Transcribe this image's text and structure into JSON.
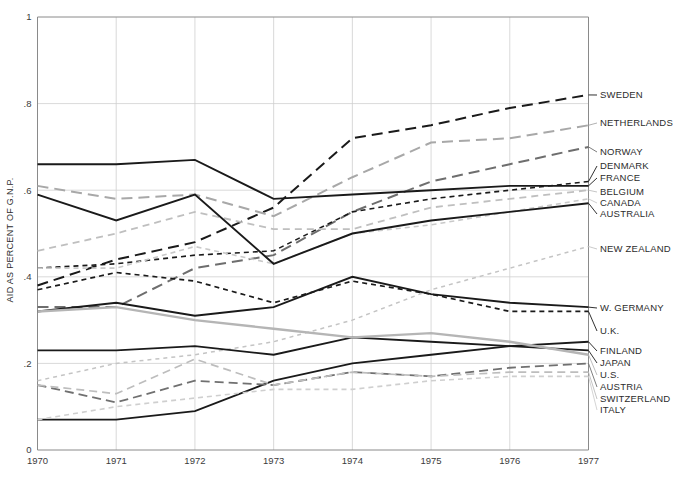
{
  "chart_data": {
    "type": "line",
    "title": "",
    "xlabel": "",
    "ylabel": "AID AS PERCENT OF G.N.P.",
    "x": [
      1970,
      1971,
      1972,
      1973,
      1974,
      1975,
      1976,
      1977
    ],
    "xtick_labels": [
      "1970",
      "1971",
      "1972",
      "1973",
      "1974",
      "1975",
      "1976",
      "1977"
    ],
    "ytick_labels": [
      "0",
      ".2",
      ".4",
      ".6",
      ".8",
      "1"
    ],
    "ytick_values": [
      0,
      0.2,
      0.4,
      0.6,
      0.8,
      1
    ],
    "xlim": [
      1970,
      1977
    ],
    "ylim": [
      0,
      1
    ],
    "grid": true,
    "legend_position": "right-labels",
    "series": [
      {
        "name": "SWEDEN",
        "label": "SWEDEN",
        "values": [
          0.38,
          0.44,
          0.48,
          0.56,
          0.72,
          0.75,
          0.79,
          0.82
        ],
        "color": "#1a1a1a",
        "dash": "11,6",
        "width": 2.0,
        "label_y": 95
      },
      {
        "name": "NETHERLANDS",
        "label": "NETHERLANDS",
        "values": [
          0.61,
          0.58,
          0.59,
          0.54,
          0.63,
          0.71,
          0.72,
          0.75
        ],
        "color": "#a8a8a8",
        "dash": "11,6",
        "width": 2.0,
        "label_y": 123
      },
      {
        "name": "NORWAY",
        "label": "NORWAY",
        "values": [
          0.33,
          0.33,
          0.42,
          0.45,
          0.55,
          0.62,
          0.66,
          0.7
        ],
        "color": "#6e6e6e",
        "dash": "11,6",
        "width": 2.0,
        "label_y": 152
      },
      {
        "name": "DENMARK",
        "label": "DENMARK",
        "values": [
          0.42,
          0.43,
          0.45,
          0.46,
          0.55,
          0.58,
          0.6,
          0.62
        ],
        "color": "#1a1a1a",
        "dash": "5,4",
        "width": 1.6,
        "label_y": 166
      },
      {
        "name": "FRANCE",
        "label": "FRANCE",
        "values": [
          0.66,
          0.66,
          0.67,
          0.58,
          0.59,
          0.6,
          0.61,
          0.61
        ],
        "color": "#1a1a1a",
        "dash": "none",
        "width": 1.9,
        "label_y": 178
      },
      {
        "name": "BELGIUM",
        "label": "BELGIUM",
        "values": [
          0.46,
          0.5,
          0.55,
          0.51,
          0.51,
          0.56,
          0.58,
          0.6
        ],
        "color": "#bfbfbf",
        "dash": "7,5",
        "width": 1.8,
        "label_y": 192
      },
      {
        "name": "CANADA",
        "label": "CANADA",
        "values": [
          0.42,
          0.42,
          0.47,
          0.43,
          0.5,
          0.52,
          0.55,
          0.58
        ],
        "color": "#c9c9c9",
        "dash": "5,4",
        "width": 1.6,
        "label_y": 203
      },
      {
        "name": "AUSTRALIA",
        "label": "AUSTRALIA",
        "values": [
          0.59,
          0.53,
          0.59,
          0.43,
          0.5,
          0.53,
          0.55,
          0.57
        ],
        "color": "#1a1a1a",
        "dash": "none",
        "width": 1.9,
        "label_y": 214
      },
      {
        "name": "NEW ZEALAND",
        "label": "NEW ZEALAND",
        "values": [
          0.16,
          0.2,
          0.22,
          0.25,
          0.3,
          0.37,
          0.42,
          0.47
        ],
        "color": "#c4c4c4",
        "dash": "4,4",
        "width": 1.5,
        "label_y": 249
      },
      {
        "name": "W.GERMANY",
        "label": "W. GERMANY",
        "values": [
          0.32,
          0.34,
          0.31,
          0.33,
          0.4,
          0.36,
          0.34,
          0.33
        ],
        "color": "#1a1a1a",
        "dash": "none",
        "width": 1.9,
        "label_y": 308
      },
      {
        "name": "UK",
        "label": "U.K.",
        "values": [
          0.37,
          0.41,
          0.39,
          0.34,
          0.39,
          0.36,
          0.32,
          0.32
        ],
        "color": "#1a1a1a",
        "dash": "5,4",
        "width": 1.7,
        "label_y": 331
      },
      {
        "name": "FINLAND",
        "label": "FINLAND",
        "values": [
          0.07,
          0.07,
          0.09,
          0.16,
          0.2,
          0.22,
          0.24,
          0.25
        ],
        "color": "#1a1a1a",
        "dash": "none",
        "width": 1.8,
        "label_y": 351
      },
      {
        "name": "JAPAN",
        "label": "JAPAN",
        "values": [
          0.23,
          0.23,
          0.24,
          0.22,
          0.26,
          0.25,
          0.24,
          0.23
        ],
        "color": "#1a1a1a",
        "dash": "none",
        "width": 1.8,
        "label_y": 363
      },
      {
        "name": "US",
        "label": "U.S.",
        "values": [
          0.32,
          0.33,
          0.3,
          0.28,
          0.26,
          0.27,
          0.25,
          0.22
        ],
        "color": "#b5b5b5",
        "dash": "none",
        "width": 2.4,
        "label_y": 375
      },
      {
        "name": "AUSTRIA",
        "label": "AUSTRIA",
        "values": [
          0.15,
          0.11,
          0.16,
          0.15,
          0.18,
          0.17,
          0.19,
          0.2
        ],
        "color": "#707070",
        "dash": "9,5",
        "width": 1.8,
        "label_y": 387
      },
      {
        "name": "SWITZERLAND",
        "label": "SWITZERLAND",
        "values": [
          0.15,
          0.13,
          0.21,
          0.15,
          0.18,
          0.17,
          0.18,
          0.18
        ],
        "color": "#bdbdbd",
        "dash": "8,5",
        "width": 1.7,
        "label_y": 399
      },
      {
        "name": "ITALY",
        "label": "ITALY",
        "values": [
          0.07,
          0.1,
          0.12,
          0.14,
          0.14,
          0.16,
          0.17,
          0.17
        ],
        "color": "#cfcfcf",
        "dash": "5,4",
        "width": 1.6,
        "label_y": 410
      }
    ]
  },
  "axes": {
    "y_axis_title": "AID AS PERCENT OF G.N.P."
  }
}
